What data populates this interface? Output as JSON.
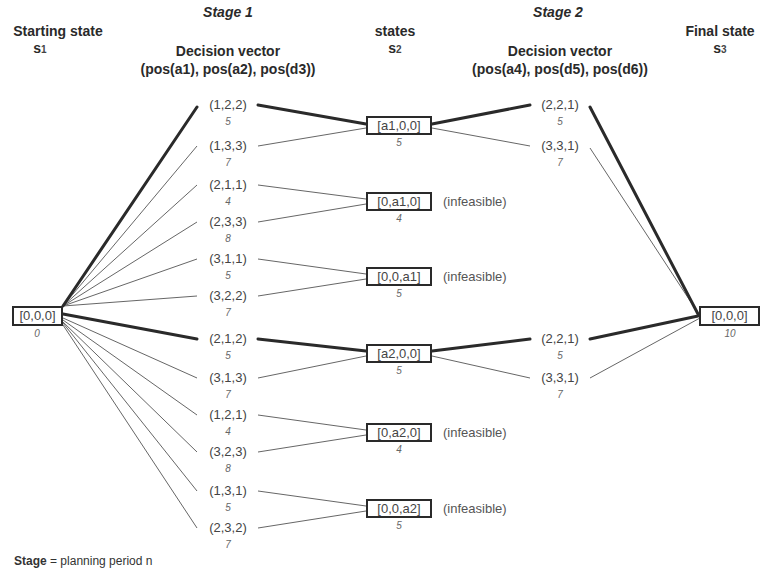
{
  "headers": {
    "stage1": "Stage 1",
    "stage2": "Stage 2",
    "starting_state": "Starting state",
    "starting_symbol": "s",
    "starting_sub": "1",
    "states": "states",
    "states_symbol": "s",
    "states_sub": "2",
    "final_state": "Final state",
    "final_symbol": "s",
    "final_sub": "3",
    "decision_vector_1": "Decision vector",
    "decision_vector_1_args": "(pos(a1), pos(a2), pos(d3))",
    "decision_vector_2": "Decision vector",
    "decision_vector_2_args": "(pos(a4), pos(d5), pos(d6))"
  },
  "start_node": {
    "label": "[0,0,0]",
    "cost": "0"
  },
  "final_node": {
    "label": "[0,0,0]",
    "cost": "10"
  },
  "stage1_decisions": [
    {
      "label": "(1,2,2)",
      "cost": "5",
      "target": 0,
      "optimal": true
    },
    {
      "label": "(1,3,3)",
      "cost": "7",
      "target": 0,
      "optimal": false
    },
    {
      "label": "(2,1,1)",
      "cost": "4",
      "target": 1,
      "optimal": false
    },
    {
      "label": "(2,3,3)",
      "cost": "8",
      "target": 1,
      "optimal": false
    },
    {
      "label": "(3,1,1)",
      "cost": "5",
      "target": 2,
      "optimal": false
    },
    {
      "label": "(3,2,2)",
      "cost": "7",
      "target": 2,
      "optimal": false
    },
    {
      "label": "(2,1,2)",
      "cost": "5",
      "target": 3,
      "optimal": true
    },
    {
      "label": "(3,1,3)",
      "cost": "7",
      "target": 3,
      "optimal": false
    },
    {
      "label": "(1,2,1)",
      "cost": "4",
      "target": 4,
      "optimal": false
    },
    {
      "label": "(3,2,3)",
      "cost": "8",
      "target": 4,
      "optimal": false
    },
    {
      "label": "(1,3,1)",
      "cost": "5",
      "target": 5,
      "optimal": false
    },
    {
      "label": "(2,3,2)",
      "cost": "7",
      "target": 5,
      "optimal": false
    }
  ],
  "stage2_states": [
    {
      "label": "[a1,0,0]",
      "cost": "5",
      "note": ""
    },
    {
      "label": "[0,a1,0]",
      "cost": "4",
      "note": "(infeasible)"
    },
    {
      "label": "[0,0,a1]",
      "cost": "5",
      "note": "(infeasible)"
    },
    {
      "label": "[a2,0,0]",
      "cost": "5",
      "note": ""
    },
    {
      "label": "[0,a2,0]",
      "cost": "4",
      "note": "(infeasible)"
    },
    {
      "label": "[0,0,a2]",
      "cost": "5",
      "note": "(infeasible)"
    }
  ],
  "stage2_decisions": [
    {
      "label": "(2,2,1)",
      "cost": "5",
      "source": 0,
      "optimal": true
    },
    {
      "label": "(3,3,1)",
      "cost": "7",
      "source": 0,
      "optimal": false
    },
    {
      "label": "(2,2,1)",
      "cost": "5",
      "source": 3,
      "optimal": true
    },
    {
      "label": "(3,3,1)",
      "cost": "7",
      "source": 3,
      "optimal": false
    }
  ],
  "footer": {
    "bold": "Stage",
    "text": " = planning period n"
  }
}
